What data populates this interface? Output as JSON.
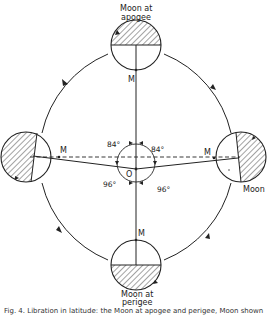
{
  "diagram": {
    "labels": {
      "top_moon": [
        "Moon at",
        "apogee"
      ],
      "bottom_moon": [
        "Moon at",
        "perigee"
      ],
      "right_moon": "Moon",
      "m_top": "M",
      "m_bottom": "M",
      "m_left": "M",
      "m_right": "M",
      "origin": "O",
      "angle_upper_left": "84°",
      "angle_upper_right": "84°",
      "angle_lower_left": "96°",
      "angle_lower_right": "96°"
    },
    "caption": "Fig. 4. Libration in latitude: the Moon at apogee and perigee, Moon shown",
    "colors": {
      "ink": "#222222",
      "background": "#ffffff"
    }
  }
}
